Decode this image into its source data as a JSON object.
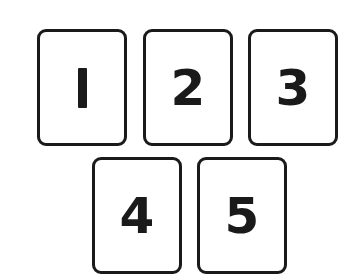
{
  "cards": [
    {
      "label": "1"
    },
    {
      "label": "2"
    },
    {
      "label": "3"
    },
    {
      "label": "4"
    },
    {
      "label": "5"
    }
  ],
  "colors": {
    "stroke": "#1a1a1a",
    "background": "#ffffff"
  }
}
